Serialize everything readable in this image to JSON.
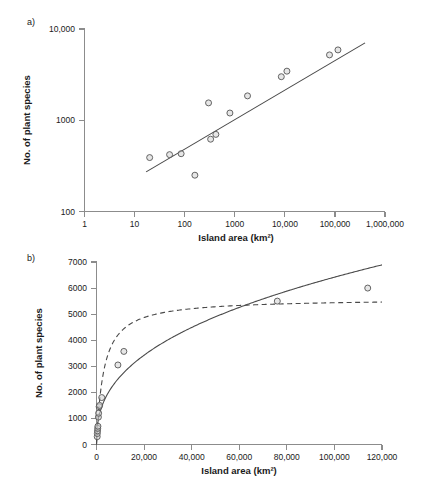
{
  "figure": {
    "panels": [
      {
        "id": "a",
        "label": "a)",
        "xlabel": "Island area (km²)",
        "ylabel": "No. of plant species"
      },
      {
        "id": "b",
        "label": "b)",
        "xlabel": "Island area (km²)",
        "ylabel": "No. of plant species"
      }
    ]
  },
  "chart_data": [
    {
      "type": "scatter",
      "panel": "a)",
      "title": "",
      "xlabel": "Island area (km²)",
      "ylabel": "No. of plant species",
      "xscale": "log",
      "yscale": "log",
      "xlim": [
        1,
        1000000
      ],
      "ylim": [
        100,
        10000
      ],
      "grid": false,
      "legend": "none",
      "xticks": [
        "1",
        "10",
        "100",
        "1000",
        "10,000",
        "100,000",
        "1,000,000"
      ],
      "xtick_values": [
        1,
        10,
        100,
        1000,
        10000,
        100000,
        1000000
      ],
      "yticks": [
        "100",
        "1000",
        "10,000"
      ],
      "ytick_values": [
        100,
        1000,
        10000
      ],
      "points": [
        {
          "x": 20,
          "y": 390
        },
        {
          "x": 50,
          "y": 420
        },
        {
          "x": 85,
          "y": 430
        },
        {
          "x": 160,
          "y": 250
        },
        {
          "x": 300,
          "y": 1550
        },
        {
          "x": 420,
          "y": 700
        },
        {
          "x": 330,
          "y": 620
        },
        {
          "x": 800,
          "y": 1200
        },
        {
          "x": 1800,
          "y": 1850
        },
        {
          "x": 8500,
          "y": 3000
        },
        {
          "x": 11000,
          "y": 3450
        },
        {
          "x": 78000,
          "y": 5200
        },
        {
          "x": 115000,
          "y": 5900
        }
      ],
      "series": [
        {
          "name": "power-law regression (log-log linear fit)",
          "style": "solid",
          "x": [
            17,
            400000
          ],
          "y": [
            272,
            7050
          ]
        }
      ]
    },
    {
      "type": "scatter",
      "panel": "b)",
      "title": "",
      "xlabel": "Island area (km²)",
      "ylabel": "No. of plant species",
      "xscale": "linear",
      "yscale": "linear",
      "xlim": [
        0,
        120000
      ],
      "ylim": [
        0,
        7000
      ],
      "grid": false,
      "legend": "none",
      "xticks": [
        "0",
        "20,000",
        "40,000",
        "60,000",
        "80,000",
        "100,000",
        "120,000"
      ],
      "xtick_values": [
        0,
        20000,
        40000,
        60000,
        80000,
        100000,
        120000
      ],
      "yticks": [
        "0",
        "1000",
        "2000",
        "3000",
        "4000",
        "5000",
        "6000",
        "7000"
      ],
      "ytick_values": [
        0,
        1000,
        2000,
        3000,
        4000,
        5000,
        6000,
        7000
      ],
      "points": [
        {
          "x": 300,
          "y": 300
        },
        {
          "x": 350,
          "y": 420
        },
        {
          "x": 420,
          "y": 520
        },
        {
          "x": 500,
          "y": 620
        },
        {
          "x": 600,
          "y": 700
        },
        {
          "x": 800,
          "y": 1050
        },
        {
          "x": 900,
          "y": 1200
        },
        {
          "x": 1100,
          "y": 1450
        },
        {
          "x": 1300,
          "y": 1500
        },
        {
          "x": 2200,
          "y": 1800
        },
        {
          "x": 9000,
          "y": 3050
        },
        {
          "x": 11500,
          "y": 3570
        },
        {
          "x": 76000,
          "y": 5500
        },
        {
          "x": 114000,
          "y": 6000
        }
      ],
      "series": [
        {
          "name": "power-function fit",
          "style": "solid",
          "model": "power",
          "coefficient": 72,
          "exponent": 0.39
        },
        {
          "name": "logarithmic / Michaelis-Menten fit",
          "style": "dashed",
          "model": "saturating",
          "asymptote": 5600,
          "half_saturation": 3000
        }
      ]
    }
  ]
}
